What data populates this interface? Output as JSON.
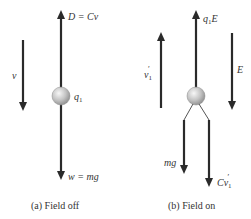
{
  "colors": {
    "arrow": "#2a2a2a",
    "text": "#333333",
    "ball_light": "#f2f2f2",
    "ball_dark": "#9a9a9a",
    "background": "#ffffff"
  },
  "panel_a": {
    "caption": "(a) Field off",
    "velocity_label": "v",
    "drag_label": "D = Cv",
    "charge_label": "q",
    "charge_sub": "1",
    "weight_label": "w = mg",
    "arrows": [
      {
        "name": "velocity",
        "direction": "down",
        "x": 23,
        "y1": 40,
        "y2": 110
      },
      {
        "name": "drag-force",
        "direction": "up",
        "x": 61,
        "y1": 88,
        "y2": 10
      },
      {
        "name": "weight-force",
        "direction": "down",
        "x": 61,
        "y1": 104,
        "y2": 180
      }
    ],
    "ball": {
      "cx": 61,
      "cy": 96,
      "r": 9
    }
  },
  "panel_b": {
    "caption": "(b) Field on",
    "velocity_label": "v",
    "velocity_sub": "1",
    "velocity_prime": "′",
    "electric_force_label_q": "q",
    "electric_force_label_sub": "1",
    "electric_force_label_E": "E",
    "field_label": "E",
    "gravity_label": "mg",
    "drag_label": "Cv",
    "drag_sub": "1",
    "drag_prime": "′",
    "arrows": [
      {
        "name": "velocity",
        "direction": "up",
        "x": 161,
        "y1": 108,
        "y2": 32
      },
      {
        "name": "electric-force",
        "direction": "up",
        "x": 196,
        "y1": 88,
        "y2": 10
      },
      {
        "name": "electric-field",
        "direction": "down",
        "x": 232,
        "y1": 33,
        "y2": 110
      },
      {
        "name": "gravity-force",
        "direction": "down",
        "x": 184,
        "y1": 120,
        "y2": 174
      },
      {
        "name": "drag-force",
        "direction": "down",
        "x": 209,
        "y1": 120,
        "y2": 187
      }
    ],
    "ball": {
      "cx": 196,
      "cy": 96,
      "r": 9
    }
  }
}
